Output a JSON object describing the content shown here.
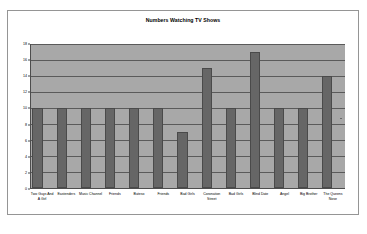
{
  "chart_data": {
    "type": "bar",
    "title": "Numbers Watching TV Shows",
    "xlabel": "",
    "ylabel": "",
    "ylim": [
      0,
      18
    ],
    "ytick_step": 2,
    "yticks": [
      "0",
      "2",
      "4",
      "6",
      "8",
      "10",
      "12",
      "14",
      "16",
      "18"
    ],
    "grid": true,
    "legend": false,
    "categories": [
      "Two Guys And A Girl",
      "Eastenders",
      "Music Channel",
      "Friends",
      "Buteso",
      "Friends",
      "Bad Girls",
      "Coronation Street",
      "Bad Girls",
      "Blind Date",
      "Angel",
      "Big Brother",
      "The Queens Nose"
    ],
    "values": [
      10,
      10,
      10,
      10,
      10,
      10,
      7,
      15,
      10,
      17,
      10,
      10,
      14
    ],
    "colors": {
      "plot_background": "#a8a8a8",
      "bar_fill": "#666666",
      "bar_border": "#4a4a4a",
      "gridline": "#5a5a5a",
      "axis": "#4d4d4d",
      "frame_border": "#959595",
      "text": "#000000",
      "page_background": "#ffffff"
    }
  }
}
